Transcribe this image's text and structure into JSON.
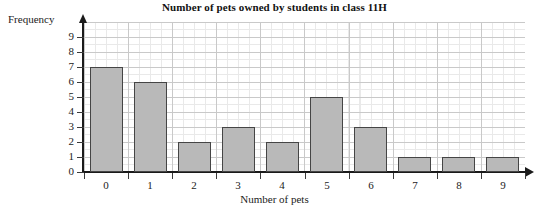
{
  "chart_data": {
    "type": "bar",
    "title": "Number of pets owned by students in class 11H",
    "xlabel": "Number of pets",
    "ylabel": "Frequency",
    "categories": [
      "0",
      "1",
      "2",
      "3",
      "4",
      "5",
      "6",
      "7",
      "8",
      "9"
    ],
    "values": [
      7,
      6,
      2,
      3,
      2,
      5,
      3,
      1,
      1,
      1
    ],
    "ylim": [
      0,
      9
    ],
    "yticks": [
      "0",
      "1",
      "2",
      "3",
      "4",
      "5",
      "6",
      "7",
      "8",
      "9"
    ],
    "grid": true,
    "legend": "none",
    "bar_fill_color": "#b9b9b9",
    "bar_border_color": "#454545",
    "grid_major_color": "#c9c9c9",
    "grid_minor_color": "#e9e9e9",
    "axis_color": "#1a1a1a"
  }
}
